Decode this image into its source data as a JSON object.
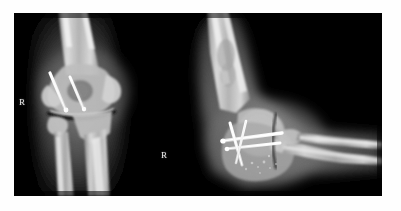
{
  "image": {
    "kind": "radiograph",
    "modality": "X-ray",
    "body_part": "Elbow",
    "side_marker": "R",
    "panel_count": 2,
    "background_color": "#ffffff",
    "film_color": "#000000",
    "bone_color": "#d8d8d8",
    "hardware_color": "#ffffff",
    "soft_tissue_color": "#4a4a4a"
  },
  "film": {
    "x": 14,
    "y": 13,
    "width": 368,
    "height": 183
  },
  "markers": [
    {
      "id": "ap",
      "label": "R",
      "x": 5,
      "y": 85
    },
    {
      "id": "lateral",
      "label": "R",
      "x": 147,
      "y": 138
    }
  ],
  "panels": [
    {
      "id": "ap-view",
      "name": "AP elbow view",
      "label": "R",
      "region": {
        "x": 0,
        "y": 0,
        "width": 125,
        "height": 183
      },
      "anatomy": [
        "distal humerus",
        "medial epicondyle",
        "lateral epicondyle",
        "capitellum",
        "trochlea",
        "radial head",
        "proximal radius",
        "proximal ulna",
        "olecranon"
      ],
      "hardware": {
        "type": "screws",
        "count": 2,
        "orientation": "oblique, medial to lateral"
      }
    },
    {
      "id": "lateral-view",
      "name": "Lateral elbow view, flexed",
      "label": "R",
      "region": {
        "x": 190,
        "y": 0,
        "width": 192,
        "height": 183
      },
      "anatomy": [
        "humeral shaft",
        "distal humerus",
        "olecranon",
        "coronoid process",
        "radial head",
        "radial shaft",
        "ulnar shaft"
      ],
      "hardware": {
        "type": "crossed pins and screws",
        "count": 4,
        "orientation": "crossed / transverse"
      }
    }
  ]
}
